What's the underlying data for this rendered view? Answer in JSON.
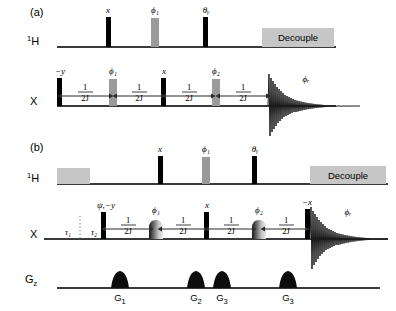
{
  "figure": {
    "colors": {
      "line": "#3a3a3a",
      "hard_pulse": "#000000",
      "soft_pulse": "#9a9a9a",
      "decouple_block": "#c6c6c6",
      "background": "#ffffff"
    }
  },
  "panels": [
    {
      "id": "a",
      "label": "(a)",
      "channels": [
        {
          "id": "h1",
          "label": "1H",
          "label_sup": "1",
          "label_base": "H",
          "pulses": [
            {
              "name": "pulse-h-x",
              "phase": "x",
              "kind": "hard",
              "x": 108
            },
            {
              "name": "pulse-h-phi1",
              "phase": "ϕ₁",
              "kind": "soft",
              "x": 155
            },
            {
              "name": "pulse-h-theta-y",
              "phase": "θᵧ",
              "kind": "hard",
              "x": 205
            }
          ],
          "blocks": [
            {
              "name": "decouple-block-a",
              "label": "Decouple",
              "x": 262,
              "width": 72
            }
          ]
        },
        {
          "id": "x",
          "label": "X",
          "pulses": [
            {
              "name": "pulse-x-minus-y",
              "phase": "−y",
              "kind": "hard",
              "x": 59
            },
            {
              "name": "pulse-x-phi1",
              "phase": "ϕ₁",
              "kind": "soft",
              "x": 112
            },
            {
              "name": "pulse-x-x",
              "phase": "x",
              "kind": "hard",
              "x": 163
            },
            {
              "name": "pulse-x-phi2",
              "phase": "ϕ₂",
              "kind": "soft",
              "x": 215
            }
          ],
          "delays": [
            {
              "name": "delay-1",
              "numerator": "1",
              "denominator": "2J",
              "from": 62,
              "to": 109
            },
            {
              "name": "delay-2",
              "numerator": "1",
              "denominator": "2J",
              "from": 117,
              "to": 161
            },
            {
              "name": "delay-3",
              "numerator": "1",
              "denominator": "2J",
              "from": 166,
              "to": 211
            },
            {
              "name": "delay-4",
              "numerator": "1",
              "denominator": "2J",
              "from": 220,
              "to": 266
            }
          ],
          "acquisition": {
            "name": "fid-a",
            "phase": "ϕᵣ",
            "x": 268,
            "label_x": 306
          }
        }
      ]
    },
    {
      "id": "b",
      "label": "(b)",
      "channels": [
        {
          "id": "h1",
          "label": "1H",
          "label_sup": "1",
          "label_base": "H",
          "pulses": [
            {
              "name": "pulse-h-x",
              "phase": "x",
              "kind": "hard",
              "x": 160
            },
            {
              "name": "pulse-h-phi1",
              "phase": "ϕ₁",
              "kind": "soft",
              "x": 206
            },
            {
              "name": "pulse-h-theta-y",
              "phase": "θᵧ",
              "kind": "hard",
              "x": 254
            }
          ],
          "blocks": [
            {
              "name": "presat-block",
              "label": "",
              "x": 57,
              "width": 33
            },
            {
              "name": "decouple-block-b",
              "label": "Decouple",
              "x": 310,
              "width": 76
            }
          ]
        },
        {
          "id": "x",
          "label": "X",
          "pulses": [
            {
              "name": "pulse-x-psi-minus-y",
              "phase": "ψ,−y",
              "kind": "hard",
              "x": 103
            },
            {
              "name": "pulse-x-phi1",
              "phase": "ϕ₁",
              "kind": "shaped",
              "x": 155
            },
            {
              "name": "pulse-x-x",
              "phase": "x",
              "kind": "hard",
              "x": 206
            },
            {
              "name": "pulse-x-phi2",
              "phase": "ϕ₂",
              "kind": "shaped",
              "x": 258
            },
            {
              "name": "pulse-x-minus-x",
              "phase": "−x",
              "kind": "hard",
              "x": 307
            }
          ],
          "delays": [
            {
              "name": "delay-1",
              "numerator": "1",
              "denominator": "2J",
              "from": 106,
              "to": 149
            },
            {
              "name": "delay-2",
              "numerator": "1",
              "denominator": "2J",
              "from": 162,
              "to": 203
            },
            {
              "name": "delay-3",
              "numerator": "1",
              "denominator": "2J",
              "from": 209,
              "to": 252
            },
            {
              "name": "delay-4",
              "numerator": "1",
              "denominator": "2J",
              "from": 265,
              "to": 305
            }
          ],
          "taus": [
            {
              "name": "tau-1",
              "label": "τ₁",
              "x": 68
            },
            {
              "name": "tau-2",
              "label": "τ₂",
              "x": 94
            }
          ],
          "acquisition": {
            "name": "fid-b",
            "phase": "ϕᵣ",
            "x": 309,
            "label_x": 348
          }
        },
        {
          "id": "gz",
          "label": "Gz",
          "label_base": "G",
          "label_sub": "z",
          "gradients": [
            {
              "name": "gradient-g1",
              "label": "G₁",
              "label_base": "G",
              "label_sub": "1",
              "x": 120
            },
            {
              "name": "gradient-g2",
              "label": "G₂",
              "label_base": "G",
              "label_sub": "2",
              "x": 196
            },
            {
              "name": "gradient-g3a",
              "label": "G₃",
              "label_base": "G",
              "label_sub": "3",
              "x": 222
            },
            {
              "name": "gradient-g3b",
              "label": "G₃",
              "label_base": "G",
              "label_sub": "3",
              "x": 288
            }
          ]
        }
      ]
    }
  ]
}
